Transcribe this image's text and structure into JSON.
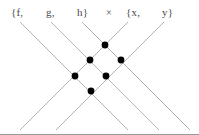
{
  "figure": {
    "width": 199,
    "height": 135,
    "background": "#ffffff",
    "line_color": "#b3b3b3",
    "dot_color": "#000000",
    "label_color": "#4a4a4a",
    "frame_color": "#9a9a9a"
  },
  "labels": {
    "left_set_open": "{f,",
    "left_set_mid": "g,",
    "left_set_close": "h}",
    "operator": "×",
    "right_set_open": "{x,",
    "right_set_close": "y}"
  },
  "chart_data": {
    "type": "scatter",
    "title": "{f, g, h} × {x, y}",
    "xlabel": "",
    "ylabel": "",
    "grid": false,
    "legend": null,
    "set_a": [
      "f",
      "g",
      "h"
    ],
    "set_b": [
      "x",
      "y"
    ],
    "points": [
      {
        "label": "h·x",
        "x": 105,
        "y": 45
      },
      {
        "label": "g·x",
        "x": 90,
        "y": 60
      },
      {
        "label": "h·y",
        "x": 121,
        "y": 60
      },
      {
        "label": "f·x",
        "x": 75,
        "y": 76
      },
      {
        "label": "g·y",
        "x": 106,
        "y": 76
      },
      {
        "label": "f·y",
        "x": 91,
        "y": 91
      }
    ],
    "dot_radius": 3.4,
    "lines_descending_right": [
      {
        "name": "f",
        "x1": 20,
        "y1": 22,
        "x2": 128,
        "y2": 130
      },
      {
        "name": "g",
        "x1": 51,
        "y1": 22,
        "x2": 159,
        "y2": 130
      },
      {
        "name": "h",
        "x1": 82,
        "y1": 22,
        "x2": 190,
        "y2": 130
      }
    ],
    "lines_descending_left": [
      {
        "name": "x",
        "x1": 128,
        "y1": 22,
        "x2": 20,
        "y2": 130
      },
      {
        "name": "y",
        "x1": 164,
        "y1": 22,
        "x2": 56,
        "y2": 130
      }
    ]
  }
}
